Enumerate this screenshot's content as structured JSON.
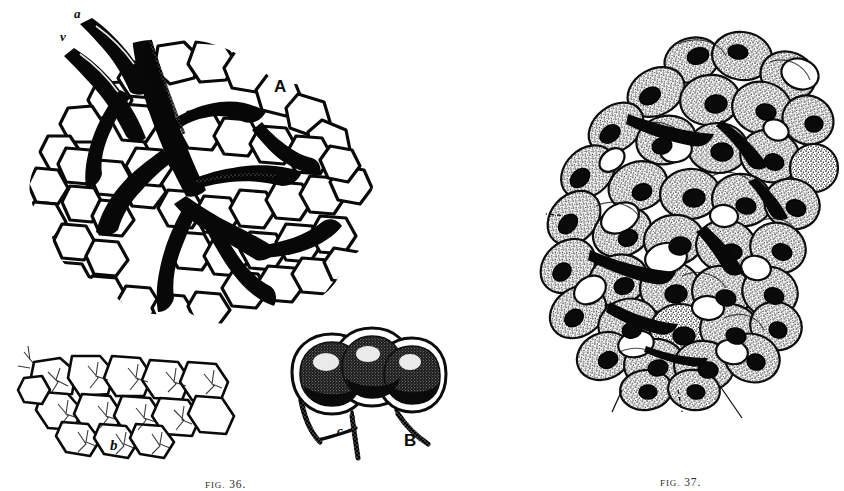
{
  "plate": {
    "background_color": "#ffffff",
    "ink_color": "#111111",
    "medium": "engraved line drawing, monochrome halftone scan"
  },
  "figures": [
    {
      "id": "fig-36",
      "caption_prefix": "FIG.",
      "caption_number": "36.",
      "caption_full": "FIG. 36.",
      "subject": "lung lobule with vascular supply and alveolar capillary network",
      "labels": [
        {
          "key": "a_vessel",
          "text": "a",
          "style": "italic",
          "meaning": "artery entering lobule"
        },
        {
          "key": "v_vessel",
          "text": "v",
          "style": "italic",
          "meaning": "vein leaving lobule"
        },
        {
          "key": "A",
          "text": "A",
          "style": "capital",
          "meaning": "whole lobule, general view"
        },
        {
          "key": "b_capillary",
          "text": "b",
          "style": "italic",
          "meaning": "alveolar capillary network"
        },
        {
          "key": "c_inset",
          "text": "c",
          "style": "italic",
          "meaning": "alveolar duct in enlarged detail"
        },
        {
          "key": "B",
          "text": "B",
          "style": "capital",
          "meaning": "enlarged group of alveoli"
        }
      ]
    },
    {
      "id": "fig-37",
      "caption_prefix": "FIG.",
      "caption_number": "37.",
      "caption_full": "FIG. 37.",
      "subject": "histological section of glandular tissue, stippled cells with nuclei and vacuoles",
      "labels": [
        {
          "key": "b_tissue",
          "text": "b",
          "style": "italic",
          "meaning": "cell group indicated by leader line"
        },
        {
          "key": "c_tissue",
          "text": "c",
          "style": "italic",
          "meaning": "structure at lower left"
        },
        {
          "key": "a_tissue",
          "text": "a",
          "style": "italic",
          "meaning": "cell body at lower margin"
        },
        {
          "key": "d_tissue",
          "text": "d",
          "style": "italic",
          "meaning": "structure at lower right"
        }
      ]
    }
  ]
}
